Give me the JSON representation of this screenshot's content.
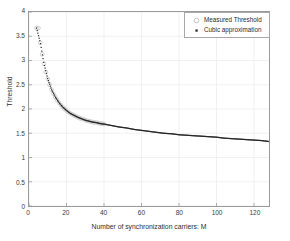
{
  "chart_data": {
    "type": "scatter",
    "title": "",
    "xlabel": "Number of synchronization carriers: M",
    "ylabel": "Threshold",
    "xlim": [
      0,
      128
    ],
    "ylim": [
      0,
      4
    ],
    "xticks": [
      0,
      20,
      40,
      60,
      80,
      100,
      120
    ],
    "yticks": [
      0,
      0.5,
      1,
      1.5,
      2,
      2.5,
      3,
      3.5,
      4
    ],
    "xtick_labels": [
      "0",
      "20",
      "40",
      "60",
      "80",
      "100",
      "120"
    ],
    "ytick_labels": [
      "0",
      "0.5",
      "1",
      "1.5",
      "2",
      "2.5",
      "3",
      "3.5",
      "4"
    ],
    "grid": true,
    "legend_position": "upper right",
    "series": [
      {
        "name": "Measured Threshold",
        "marker": "open-circle",
        "color": "#c8c8c8",
        "x": [
          4,
          5,
          6,
          7,
          8,
          9,
          10,
          11,
          12,
          13,
          14,
          15,
          16,
          17,
          18,
          19,
          20,
          21,
          22,
          23,
          24,
          25,
          26,
          27,
          28,
          29,
          30,
          31,
          32,
          33,
          34,
          35,
          36,
          37,
          38,
          39,
          40
        ],
        "y": [
          3.67,
          3.67,
          3.37,
          3.13,
          2.93,
          2.76,
          2.62,
          2.5,
          2.4,
          2.32,
          2.25,
          2.19,
          2.13,
          2.08,
          2.04,
          2.0,
          1.97,
          1.94,
          1.91,
          1.89,
          1.87,
          1.85,
          1.83,
          1.81,
          1.8,
          1.79,
          1.77,
          1.76,
          1.75,
          1.74,
          1.73,
          1.72,
          1.72,
          1.71,
          1.7,
          1.7,
          1.69
        ]
      },
      {
        "name": "Cubic approximation",
        "marker": "filled-dot",
        "color": "#222222",
        "x": [
          4,
          6,
          8,
          10,
          12,
          14,
          16,
          18,
          20,
          22,
          24,
          26,
          28,
          30,
          32,
          34,
          36,
          38,
          40,
          44,
          48,
          52,
          56,
          60,
          64,
          68,
          72,
          76,
          80,
          84,
          88,
          92,
          96,
          100,
          104,
          108,
          112,
          116,
          120,
          124,
          128
        ],
        "y": [
          3.67,
          3.37,
          2.93,
          2.62,
          2.4,
          2.25,
          2.13,
          2.04,
          1.97,
          1.91,
          1.87,
          1.83,
          1.8,
          1.77,
          1.75,
          1.73,
          1.72,
          1.7,
          1.69,
          1.66,
          1.63,
          1.61,
          1.58,
          1.56,
          1.54,
          1.52,
          1.5,
          1.49,
          1.47,
          1.46,
          1.45,
          1.44,
          1.43,
          1.42,
          1.4,
          1.39,
          1.38,
          1.37,
          1.36,
          1.35,
          1.33
        ]
      }
    ]
  },
  "legend": {
    "entries": [
      {
        "label": "Measured Threshold",
        "marker": "open-circle-marker"
      },
      {
        "label": "Cubic approximation",
        "marker": "filled-dot-marker"
      }
    ]
  },
  "axes": {
    "ylabel": "Threshold",
    "xlabel": "Number of synchronization carriers: M"
  },
  "colors": {
    "measured": "#c8c8c8",
    "cubic": "#222222",
    "axis": "#9a9a9a",
    "grid": "#ededed",
    "text": "#2e2e2e",
    "background": "#ffffff"
  }
}
